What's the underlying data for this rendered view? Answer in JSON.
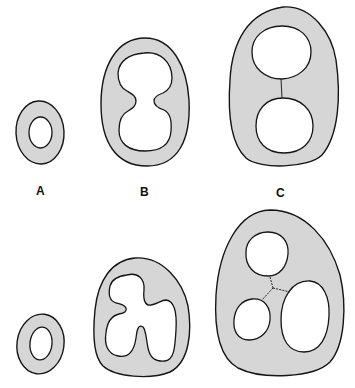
{
  "figure": {
    "colors": {
      "background": "#ffffff",
      "wall_fill": "#d6d6d6",
      "outline": "#151515",
      "lumen_fill": "#ffffff"
    },
    "labels": {
      "a": "A",
      "b": "B",
      "c": "C"
    },
    "panels": [
      {
        "id": "A-top",
        "row": 1,
        "column": "A",
        "lumen_count": 1,
        "lumen_shape": "oval"
      },
      {
        "id": "B-top",
        "row": 1,
        "column": "B",
        "lumen_count": 1,
        "lumen_shape": "constricted (dumbbell)"
      },
      {
        "id": "C-top",
        "row": 1,
        "column": "C",
        "lumen_count": 2,
        "lumen_shape": "two circles with septum"
      },
      {
        "id": "A-bottom",
        "row": 2,
        "column": "A",
        "lumen_count": 1,
        "lumen_shape": "oval"
      },
      {
        "id": "B-bottom",
        "row": 2,
        "column": "B",
        "lumen_count": 1,
        "lumen_shape": "three-lobed (cloverleaf)"
      },
      {
        "id": "C-bottom",
        "row": 2,
        "column": "C",
        "lumen_count": 3,
        "lumen_shape": "three lumens with Y-shaped septa"
      }
    ]
  }
}
